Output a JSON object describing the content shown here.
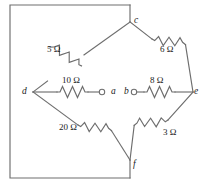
{
  "figure": {
    "kind": "circuit-diagram",
    "line_color": "#6e6e6e",
    "text_color": "#1a1a1a",
    "background": "#ffffff"
  },
  "nodes": [
    {
      "id": "c",
      "label": "c",
      "x": 130,
      "y": 22,
      "role": "top-vertex"
    },
    {
      "id": "d",
      "label": "d",
      "x": 33,
      "y": 92,
      "role": "left-vertex"
    },
    {
      "id": "e",
      "label": "e",
      "x": 193,
      "y": 92,
      "role": "right-vertex"
    },
    {
      "id": "f",
      "label": "f",
      "x": 130,
      "y": 160,
      "role": "bottom-vertex"
    }
  ],
  "terminals": [
    {
      "id": "a",
      "label": "a",
      "x": 103,
      "y": 92,
      "type": "open-circle"
    },
    {
      "id": "b",
      "label": "b",
      "x": 134,
      "y": 92,
      "type": "open-circle"
    }
  ],
  "resistors": [
    {
      "id": "r5",
      "value": "5 Ω",
      "ohms": 5,
      "between": [
        "c",
        "d"
      ],
      "orientation": "diagonal-down-left"
    },
    {
      "id": "r6",
      "value": "6 Ω",
      "ohms": 6,
      "between": [
        "c",
        "e"
      ],
      "orientation": "diagonal-down-right"
    },
    {
      "id": "r10",
      "value": "10 Ω",
      "ohms": 10,
      "between": [
        "d",
        "a"
      ],
      "orientation": "horizontal"
    },
    {
      "id": "r8",
      "value": "8 Ω",
      "ohms": 8,
      "between": [
        "b",
        "e"
      ],
      "orientation": "horizontal"
    },
    {
      "id": "r20",
      "value": "20 Ω",
      "ohms": 20,
      "between": [
        "d",
        "f"
      ],
      "orientation": "diagonal-down-right"
    },
    {
      "id": "r3",
      "value": "3 Ω",
      "ohms": 3,
      "between": [
        "e",
        "f"
      ],
      "orientation": "diagonal-down-left"
    }
  ],
  "labels": {
    "c": "c",
    "d": "d",
    "e": "e",
    "f": "f",
    "a": "a",
    "b": "b",
    "r5": "5 Ω",
    "r6": "6 Ω",
    "r10": "10 Ω",
    "r8": "8 Ω",
    "r20": "20 Ω",
    "r3": "3 Ω"
  },
  "outer_loop": {
    "path": "rectangle from node c left across top, down left side, across bottom, up to node f",
    "left": 10,
    "top": 5,
    "right": 130,
    "bottom": 178
  }
}
